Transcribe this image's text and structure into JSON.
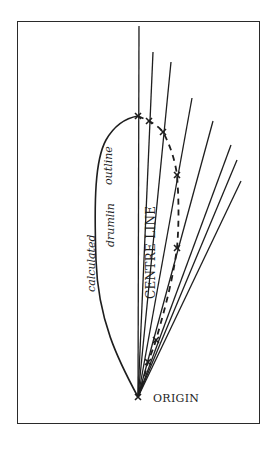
{
  "diagram": {
    "labels": {
      "origin": "ORIGIN",
      "centre_line": "CENTRE LINE",
      "outline_word1": "calculated",
      "outline_word2": "drumlin",
      "outline_word3": "outline"
    },
    "colors": {
      "line": "#1e1e1e",
      "background": "#ffffff"
    },
    "origin_point": [
      138,
      397
    ],
    "rays": [
      {
        "name": "centre-line",
        "end": [
          139,
          26
        ]
      },
      {
        "name": "ray-2",
        "end": [
          153,
          52
        ]
      },
      {
        "name": "ray-3",
        "end": [
          171,
          62
        ]
      },
      {
        "name": "ray-4",
        "end": [
          192,
          98
        ]
      },
      {
        "name": "ray-5",
        "end": [
          213,
          121
        ]
      },
      {
        "name": "ray-6",
        "end": [
          231,
          145
        ]
      },
      {
        "name": "ray-7",
        "end": [
          237,
          160
        ]
      },
      {
        "name": "ray-8",
        "end": [
          241,
          181
        ]
      }
    ],
    "marked_points": [
      [
        138,
        116
      ],
      [
        149,
        121
      ],
      [
        163,
        132
      ],
      [
        177,
        175
      ],
      [
        177,
        248
      ],
      [
        156,
        340
      ],
      [
        148,
        362
      ],
      [
        138,
        397
      ]
    ]
  }
}
